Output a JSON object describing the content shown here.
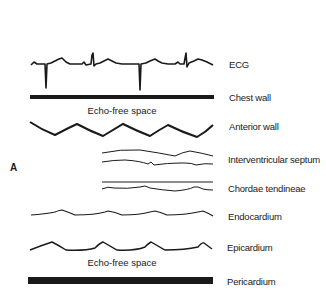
{
  "panel_letter": "A",
  "labels": {
    "ecg": "ECG",
    "chest_wall": "Chest wall",
    "anterior_wall": "Anterior wall",
    "interventricular_septum": "Interventricular septum",
    "chordae_tendineae": "Chordae tendineae",
    "endocardium": "Endocardium",
    "epicardium": "Epicardium",
    "pericardium": "Pericardium"
  },
  "annotations": {
    "echo_free_top": "Echo-free space",
    "echo_free_bottom": "Echo-free space"
  },
  "colors": {
    "line": "#1a1a1a",
    "background": "#ffffff"
  }
}
